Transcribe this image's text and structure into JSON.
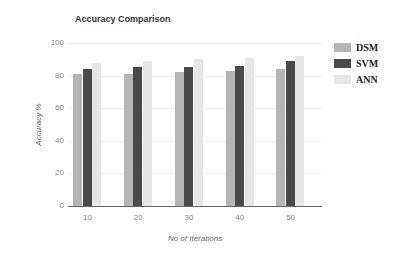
{
  "chart_data": {
    "type": "bar",
    "title": "Accuracy Comparison",
    "xlabel": "No of Iterations",
    "ylabel": "Accuracy %",
    "categories": [
      "10",
      "20",
      "30",
      "40",
      "50"
    ],
    "series": [
      {
        "name": "DSM",
        "color": "#b5b5b5",
        "values": [
          81,
          81,
          82,
          83,
          84
        ]
      },
      {
        "name": "SVM",
        "color": "#4a4a4a",
        "values": [
          84,
          85,
          85,
          86,
          89
        ]
      },
      {
        "name": "ANN",
        "color": "#e6e6e6",
        "values": [
          88,
          89,
          90,
          91,
          92
        ]
      }
    ],
    "ylim": [
      0,
      100
    ],
    "yticks": [
      "0",
      "20",
      "40",
      "60",
      "80",
      "100"
    ],
    "grid": true,
    "legend_position": "right"
  }
}
